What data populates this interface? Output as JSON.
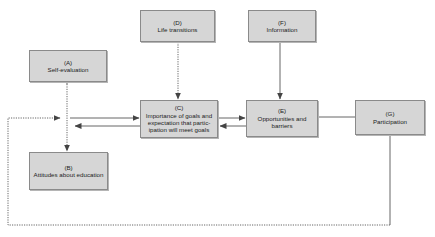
{
  "diagram": {
    "nodes": [
      {
        "id": "A",
        "letter": "(A)",
        "text": "Self-evaluation"
      },
      {
        "id": "B",
        "letter": "(B)",
        "text": "Attitudes about education"
      },
      {
        "id": "C",
        "letter": "(C)",
        "text": "Importance of goals and expectation that partic- ipation will meet goals"
      },
      {
        "id": "D",
        "letter": "(D)",
        "text": "Life transitions"
      },
      {
        "id": "E",
        "letter": "(E)",
        "text": "Opportunities and barriers"
      },
      {
        "id": "F",
        "letter": "(F)",
        "text": "Information"
      },
      {
        "id": "G",
        "letter": "(G)",
        "text": "Participation"
      }
    ],
    "edges": [
      {
        "from": "A",
        "to": "B",
        "style": "dotted",
        "direction": "both"
      },
      {
        "from": "D",
        "to": "C",
        "style": "dotted",
        "direction": "forward"
      },
      {
        "from": "F",
        "to": "E",
        "style": "solid",
        "direction": "forward"
      },
      {
        "from": "A-B link",
        "to": "C",
        "style": "solid",
        "direction": "forward"
      },
      {
        "from": "C",
        "to": "A-B link",
        "style": "solid",
        "direction": "forward"
      },
      {
        "from": "C",
        "to": "E",
        "style": "solid",
        "direction": "forward"
      },
      {
        "from": "E",
        "to": "C",
        "style": "solid",
        "direction": "forward"
      },
      {
        "from": "E",
        "to": "G",
        "style": "solid",
        "direction": "none"
      },
      {
        "from": "G",
        "to": "A-B link",
        "style": "dotted",
        "direction": "forward",
        "note": "feedback loop"
      }
    ],
    "colors": {
      "box_fill": "#d6d6d6",
      "box_border": "#8a8a8a",
      "line": "#555555"
    }
  }
}
